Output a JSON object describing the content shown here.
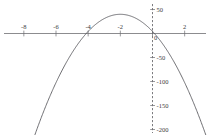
{
  "chart_data": {
    "type": "line",
    "title": "",
    "subtitle": "",
    "xlabel": "",
    "ylabel": "",
    "xlim": [
      -8.6,
      4.4
    ],
    "ylim": [
      -215,
      62
    ],
    "grid": false,
    "legend": null,
    "x_ticks": [
      {
        "value": -8,
        "label": "-8"
      },
      {
        "value": -6,
        "label": "-6"
      },
      {
        "value": -4,
        "label": "-4"
      },
      {
        "value": -2,
        "label": "-2"
      },
      {
        "value": 0,
        "label": "0"
      },
      {
        "value": 2,
        "label": "2"
      },
      {
        "value": 4,
        "label": "4"
      }
    ],
    "y_ticks": [
      {
        "value": 50,
        "label": "50"
      },
      {
        "value": 0,
        "label": "0"
      },
      {
        "value": -50,
        "label": "-50"
      },
      {
        "value": -100,
        "label": "-100"
      },
      {
        "value": -150,
        "label": "-150"
      },
      {
        "value": -200,
        "label": "-200"
      }
    ],
    "series": [
      {
        "name": "parabola",
        "color": "#55555a",
        "vertex": {
          "x": -2,
          "y": 40
        },
        "roots": [
          -4.12,
          0.12
        ],
        "x": [
          -7.1,
          -6.8,
          -6.5,
          -6.2,
          -5.9,
          -5.6,
          -5.3,
          -5.0,
          -4.7,
          -4.4,
          -4.1,
          -3.8,
          -3.5,
          -3.2,
          -2.9,
          -2.6,
          -2.3,
          -2.0,
          -1.7,
          -1.4,
          -1.1,
          -0.8,
          -0.5,
          -0.2,
          0.1,
          0.4,
          0.7,
          1.0,
          1.3,
          1.6,
          1.9,
          2.2,
          2.5,
          2.8,
          3.1,
          3.4
        ],
        "y": [
          -190.1,
          -175.4,
          -161.1,
          -147.4,
          -134.1,
          -121.4,
          -109.1,
          -97.4,
          -86.1,
          -75.4,
          -65.1,
          -55.4,
          -46.1,
          -37.4,
          -29.1,
          -21.4,
          -14.1,
          40.0,
          33.1,
          27.4,
          21.1,
          15.4,
          9.1,
          3.4,
          -2.9,
          -9.4,
          -16.1,
          -23.4,
          -31.1,
          -39.4,
          -48.1,
          -57.4,
          -67.1,
          -77.4,
          -88.1,
          -99.4
        ]
      }
    ],
    "axes": {
      "x_axis_style": "solid",
      "y_axis_style": "dashed",
      "axis_color": "#6e6e72"
    }
  }
}
